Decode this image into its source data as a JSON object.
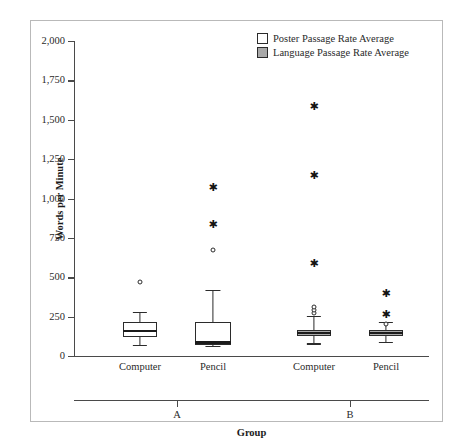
{
  "page": {
    "cut_off_header": "—   —   —   ·   ▪"
  },
  "legend": {
    "position": "top-right",
    "items": [
      {
        "label": "Poster Passage Rate Average",
        "swatch": "white"
      },
      {
        "label": "Language Passage Rate Average",
        "swatch": "gray"
      }
    ]
  },
  "axes": {
    "y_title": "Words per Minute",
    "x_title": "Group",
    "y_ticks": [
      "0",
      "250",
      "500",
      "750",
      "1,000",
      "1,250",
      "1,500",
      "1,750",
      "2,000"
    ],
    "x_tick_labels": [
      "Computer",
      "Pencil",
      "Computer",
      "Pencil"
    ],
    "group_labels": [
      "A",
      "B"
    ]
  },
  "chart_data": {
    "type": "box",
    "title": "",
    "subtitle": "",
    "xlabel": "Group",
    "ylabel": "Words per Minute",
    "ylim": [
      0,
      2000
    ],
    "ytick_values": [
      0,
      250,
      500,
      750,
      1000,
      1250,
      1500,
      1750,
      2000
    ],
    "grid": false,
    "legend_position": "top-right",
    "categories": [
      "A — Computer",
      "A — Pencil",
      "B — Computer",
      "B — Pencil"
    ],
    "series": [
      {
        "name": "Poster Passage Rate Average",
        "color": "#ffffff"
      },
      {
        "name": "Language Passage Rate Average",
        "color": "#a9a9a9"
      }
    ],
    "boxes": [
      {
        "group": "A",
        "condition": "Computer",
        "series": "Poster Passage Rate Average",
        "whisker_low": 70,
        "q1": 120,
        "median": 160,
        "q3": 215,
        "whisker_high": 280,
        "outliers_circle": [
          470
        ],
        "outliers_star": []
      },
      {
        "group": "A",
        "condition": "Pencil",
        "series": "Poster Passage Rate Average",
        "whisker_low": 65,
        "q1": 70,
        "median": 85,
        "q3": 215,
        "whisker_high": 420,
        "outliers_circle": [
          675
        ],
        "outliers_star": [
          835,
          1075
        ]
      },
      {
        "group": "B",
        "condition": "Computer",
        "series": "Language Passage Rate Average",
        "whisker_low": 80,
        "q1": 128,
        "median": 145,
        "q3": 165,
        "whisker_high": 255,
        "outliers_circle": [
          270,
          295,
          310
        ],
        "outliers_star": [
          590,
          1150,
          1590
        ]
      },
      {
        "group": "B",
        "condition": "Pencil",
        "series": "Language Passage Rate Average",
        "whisker_low": 90,
        "q1": 125,
        "median": 145,
        "q3": 165,
        "whisker_high": 215,
        "outliers_circle": [
          205
        ],
        "outliers_star": [
          265,
          400
        ]
      }
    ]
  }
}
